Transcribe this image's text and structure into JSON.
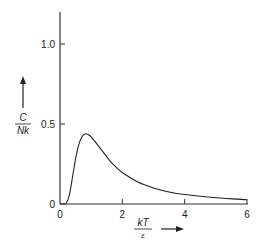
{
  "chart_data": {
    "type": "line",
    "title": "",
    "xlabel_numerator": "kT",
    "xlabel_denominator": "ε",
    "ylabel_numerator": "C",
    "ylabel_denominator": "Nk",
    "xlim": [
      0,
      6
    ],
    "ylim": [
      0,
      1.15
    ],
    "grid": false,
    "legend": null,
    "x_ticks": [
      0,
      2,
      4,
      6
    ],
    "x_tick_labels": [
      "0",
      "2",
      "4",
      "6"
    ],
    "y_ticks": [
      0,
      0.5,
      1.0
    ],
    "y_tick_labels": [
      "0",
      "0.5",
      "1.0"
    ],
    "series": [
      {
        "name": "C/Nk",
        "x": [
          0,
          0.1,
          0.2,
          0.3,
          0.4,
          0.5,
          0.6,
          0.7,
          0.8,
          0.9,
          1.0,
          1.2,
          1.4,
          1.6,
          1.8,
          2.0,
          2.5,
          3.0,
          3.5,
          4.0,
          5.0,
          6.0
        ],
        "values": [
          0,
          0.0,
          0.005,
          0.056,
          0.166,
          0.283,
          0.37,
          0.419,
          0.438,
          0.435,
          0.42,
          0.371,
          0.321,
          0.27,
          0.23,
          0.197,
          0.137,
          0.1,
          0.075,
          0.059,
          0.039,
          0.027
        ]
      }
    ]
  }
}
